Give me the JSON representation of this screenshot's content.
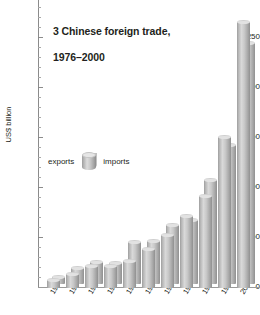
{
  "chart_data": {
    "type": "bar",
    "title": "3 Chinese foreign trade,\n1976–2000",
    "title_line1": "3 Chinese foreign trade,",
    "title_line2": "1976–2000",
    "xlabel": "",
    "ylabel": "US$ billion",
    "ylim": [
      0,
      300
    ],
    "grid": false,
    "legend_position": "inside-upper-left",
    "y_ticks": [
      0,
      50,
      100,
      150,
      200,
      250,
      300
    ],
    "y_tick_labels": [
      "0",
      "50",
      "100",
      "150",
      "200",
      "250",
      "300"
    ],
    "y_minor_step": 10,
    "categories": [
      "1977",
      "1979",
      "1981",
      "1983",
      "1985",
      "1987",
      "1989",
      "1991",
      "1993",
      "1996",
      "2000"
    ],
    "series": [
      {
        "name": "exports",
        "values": [
          8,
          14,
          22,
          22,
          27,
          39,
          53,
          72,
          92,
          151,
          266
        ]
      },
      {
        "name": "imports",
        "values": [
          7,
          16,
          22,
          21,
          42,
          43,
          59,
          64,
          104,
          139,
          241
        ]
      }
    ],
    "colors": {
      "bar_fill": "#c9c9c9",
      "bar_highlight": "#dcdcdc",
      "bar_shadow": "#909090",
      "axis": "#8b8b8b",
      "text": "#231f20",
      "background": "#ffffff"
    }
  },
  "legend": {
    "left_label": "exports",
    "right_label": "imports",
    "swatch_name": "cylinder-swatch"
  }
}
